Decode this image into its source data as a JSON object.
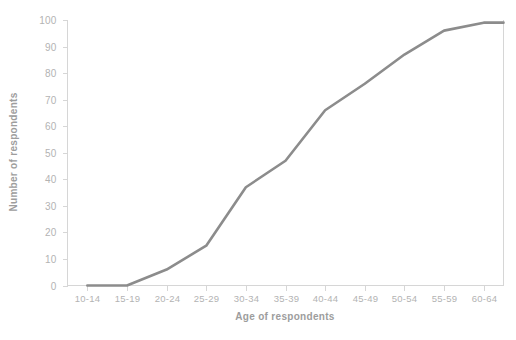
{
  "chart_data": {
    "type": "line",
    "title": "",
    "subtitle": "",
    "xlabel": "Age of respondents",
    "ylabel": "Number of respondents",
    "categories": [
      "10-14",
      "15-19",
      "20-24",
      "25-29",
      "30-34",
      "35-39",
      "40-44",
      "45-49",
      "50-54",
      "55-59",
      "60-64"
    ],
    "values": [
      0,
      0,
      6,
      15,
      37,
      47,
      66,
      76,
      87,
      96,
      99
    ],
    "series": [
      {
        "name": "Number of respondents",
        "values": [
          0,
          0,
          6,
          15,
          37,
          47,
          66,
          76,
          87,
          96,
          99
        ]
      }
    ],
    "ylim": [
      0,
      100
    ],
    "ytick_labels": [
      "0",
      "10",
      "20",
      "30",
      "40",
      "50",
      "60",
      "70",
      "80",
      "90",
      "100"
    ],
    "ytick_values": [
      0,
      10,
      20,
      30,
      40,
      50,
      60,
      70,
      80,
      90,
      100
    ],
    "grid": false,
    "legend": "none",
    "line_color": "#8c8c8c",
    "axis_color": "#d6d6d6",
    "tick_label_color": "#b3b3b3",
    "axis_title_color": "#9d9d9d",
    "background_color": "#ffffff"
  }
}
